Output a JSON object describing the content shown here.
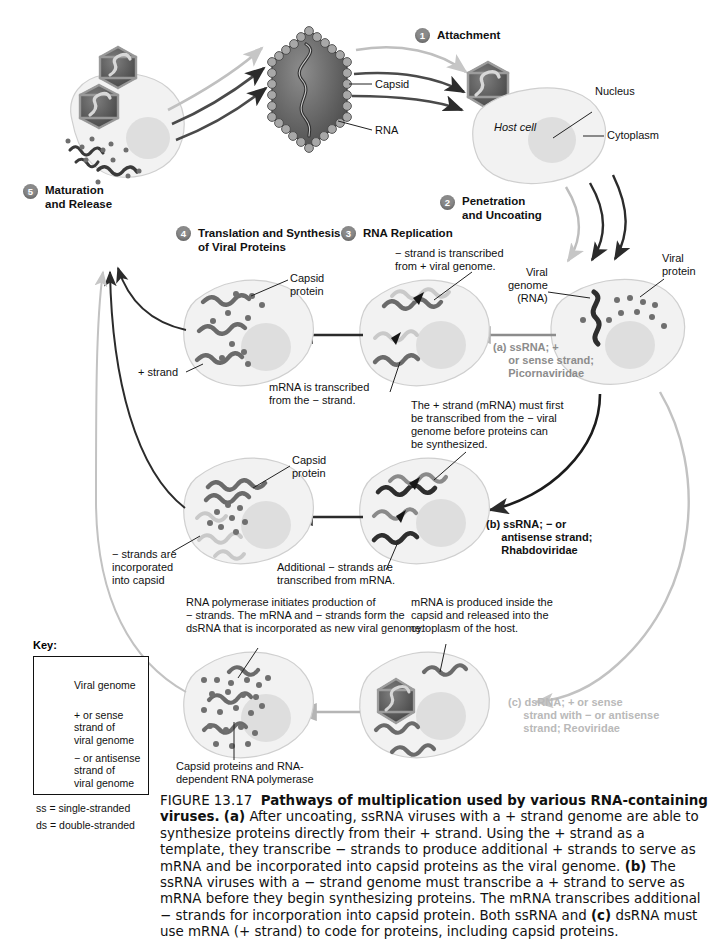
{
  "figure": {
    "number": "FIGURE 13.17",
    "title": "Pathways of multiplication used by various RNA-containing viruses.",
    "caption_a_label": "(a)",
    "caption_a": " After uncoating, ssRNA viruses with a + strand genome are able to synthesize proteins directly from their + strand. Using the + strand as a template, they transcribe − strands to produce additional + strands to serve as mRNA and be incorporated into capsid proteins as the viral genome. ",
    "caption_b_label": "(b)",
    "caption_b": " The ssRNA viruses with a − strand genome must transcribe a + strand to serve as mRNA before they begin synthesizing proteins. The mRNA transcribes additional − strands for incorporation into capsid protein. Both ssRNA and ",
    "caption_c_label": "(c)",
    "caption_c": " dsRNA must use mRNA (+ strand) to code for proteins, including capsid proteins."
  },
  "steps": [
    {
      "number": "1",
      "label": "Attachment"
    },
    {
      "number": "2",
      "label": "Penetration\nand Uncoating"
    },
    {
      "number": "3",
      "label": "RNA Replication"
    },
    {
      "number": "4",
      "label": "Translation and Synthesis\nof Viral Proteins"
    },
    {
      "number": "5",
      "label": "Maturation\nand Release"
    }
  ],
  "virion": {
    "capsid_label": "Capsid",
    "rna_label": "RNA"
  },
  "host_cell": {
    "name_label": "Host cell",
    "nucleus_label": "Nucleus",
    "cytoplasm_label": "Cytoplasm"
  },
  "uncoated_cell": {
    "viral_genome_label": "Viral\ngenome\n(RNA)",
    "viral_protein_label": "Viral\nprotein"
  },
  "pathways": [
    {
      "id": "a",
      "text": "(a) ssRNA; +\n     or sense strand;\n     Picornaviridae",
      "color": "#8c8c8c"
    },
    {
      "id": "b",
      "text": "(b) ssRNA; − or\n     antisense strand;\n     Rhabdoviridae",
      "color": "#111111"
    },
    {
      "id": "c",
      "text": "(c) dsRNA; + or sense\n     strand with − or antisense\n     strand; Reoviridae",
      "color": "#b9b9b9"
    }
  ],
  "annotations": {
    "minus_transcribed": "− strand is transcribed\nfrom + viral genome.",
    "mrna_transcribed": "mRNA is transcribed\nfrom the − strand.",
    "capsid_protein_a": "Capsid\nprotein",
    "plus_strand": "+ strand",
    "plus_must_first": "The + strand (mRNA) must first\nbe transcribed from the − viral\ngenome before proteins can\nbe synthesized.",
    "capsid_protein_b": "Capsid\nprotein",
    "minus_incorporated": "− strands are\nincorporated\ninto capsid",
    "additional_minus": "Additional − strands are\ntranscribed from mRNA.",
    "rna_polymerase": "RNA polymerase initiates production of\n− strands. The mRNA and − strands form the\ndsRNA that is incorporated as new viral genome.",
    "mrna_inside_capsid": "mRNA is produced inside the\ncapsid and released into the\ncytoplasm of the host.",
    "capsid_proteins_polymerase": "Capsid proteins and RNA-\ndependent RNA polymerase"
  },
  "key": {
    "title": "Key:",
    "items": [
      {
        "label": "Viral genome",
        "color": "#3a3a3a"
      },
      {
        "label": "+ or sense\nstrand of\nviral genome",
        "color": "#8a8a8a"
      },
      {
        "label": "− or antisense\nstrand of\nviral genome",
        "color": "#c9c9c9"
      }
    ],
    "footnotes": [
      "ss = single-stranded",
      "ds = double-stranded"
    ]
  },
  "colors": {
    "dark_strand": "#3a3a3a",
    "mid_strand": "#8a8a8a",
    "light_strand": "#c9c9c9",
    "cell_fill": "#f2f2f2",
    "cell_stroke": "#c8c8c8",
    "nucleus_fill": "#dedede",
    "badge": "#8a8a8a"
  }
}
